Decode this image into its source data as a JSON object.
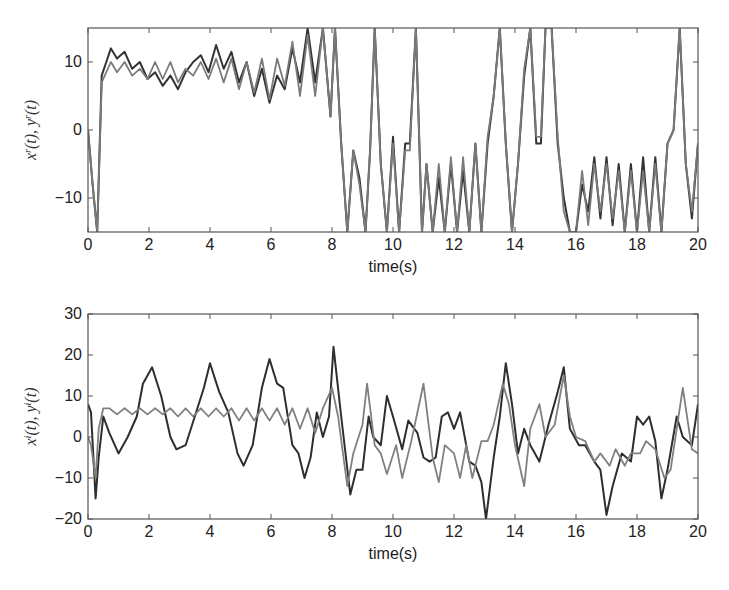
{
  "chart_data": [
    {
      "type": "line",
      "title": "",
      "xlabel": "time(s)",
      "ylabel": "x^r(t), y^r(t)",
      "xlim": [
        0,
        20
      ],
      "ylim": [
        -15,
        15
      ],
      "xticks": [
        0,
        2,
        4,
        6,
        8,
        10,
        12,
        14,
        16,
        18,
        20
      ],
      "yticks": [
        -10,
        0,
        10
      ],
      "grid": false,
      "legend": null,
      "series": [
        {
          "name": "x^r(t)",
          "color": "#333333",
          "x": [
            0,
            0.15,
            0.3,
            0.45,
            0.6,
            0.75,
            0.95,
            1.2,
            1.45,
            1.7,
            1.95,
            2.2,
            2.45,
            2.7,
            2.95,
            3.2,
            3.45,
            3.7,
            3.95,
            4.2,
            4.45,
            4.7,
            4.95,
            5.2,
            5.45,
            5.7,
            5.95,
            6.2,
            6.45,
            6.7,
            6.95,
            7.2,
            7.45,
            7.7,
            7.95,
            8.1,
            8.3,
            8.5,
            8.7,
            8.9,
            9.1,
            9.25,
            9.4,
            9.6,
            9.8,
            10.0,
            10.2,
            10.4,
            10.55,
            10.75,
            10.95,
            11.1,
            11.3,
            11.5,
            11.7,
            11.9,
            12.1,
            12.3,
            12.5,
            12.7,
            12.9,
            13.1,
            13.3,
            13.5,
            13.7,
            13.9,
            14.1,
            14.3,
            14.5,
            14.7,
            14.85,
            15.0,
            15.2,
            15.4,
            15.6,
            15.8,
            16.0,
            16.2,
            16.4,
            16.6,
            16.8,
            17.0,
            17.2,
            17.4,
            17.6,
            17.8,
            18.0,
            18.2,
            18.4,
            18.6,
            18.8,
            19.0,
            19.2,
            19.4,
            19.6,
            19.8,
            20.0
          ],
          "y": [
            0,
            -8,
            -15,
            8,
            10,
            12,
            10.5,
            11.5,
            9,
            10,
            7.5,
            8.5,
            6.5,
            8,
            6,
            8.5,
            10,
            11,
            8.5,
            12.5,
            9,
            11.5,
            7,
            10,
            5,
            9,
            4,
            8,
            6,
            12,
            7,
            15,
            7,
            15,
            2,
            15,
            -2,
            -15,
            -3,
            -7,
            -15,
            -3,
            15,
            -5,
            -15,
            -1,
            -15,
            -2,
            -2,
            15,
            -15,
            -5,
            -15,
            -7,
            -15,
            -5,
            -15,
            -6,
            -15,
            -2,
            -15,
            -2,
            5,
            15,
            -2,
            -15,
            -5,
            8,
            15,
            -2,
            -2,
            15,
            15,
            -2,
            -10,
            -15,
            -15,
            -8,
            -12,
            -4,
            -13,
            -4,
            -14,
            -5,
            -15,
            -5,
            -15,
            -4,
            -15,
            -4,
            -15,
            -2,
            0,
            15,
            -5,
            -13,
            -2
          ]
        },
        {
          "name": "y^r(t)",
          "color": "#7a7a7a",
          "x": [
            0,
            0.15,
            0.3,
            0.45,
            0.6,
            0.75,
            0.95,
            1.2,
            1.45,
            1.7,
            1.95,
            2.2,
            2.45,
            2.7,
            2.95,
            3.2,
            3.45,
            3.7,
            3.95,
            4.2,
            4.45,
            4.7,
            4.95,
            5.2,
            5.45,
            5.7,
            5.95,
            6.2,
            6.45,
            6.7,
            6.95,
            7.2,
            7.45,
            7.7,
            7.95,
            8.1,
            8.3,
            8.5,
            8.7,
            8.9,
            9.1,
            9.25,
            9.4,
            9.6,
            9.8,
            10.0,
            10.2,
            10.4,
            10.55,
            10.75,
            10.95,
            11.1,
            11.3,
            11.5,
            11.7,
            11.9,
            12.1,
            12.3,
            12.5,
            12.7,
            12.9,
            13.1,
            13.3,
            13.5,
            13.7,
            13.9,
            14.1,
            14.3,
            14.5,
            14.7,
            14.85,
            15.0,
            15.2,
            15.4,
            15.6,
            15.8,
            16.0,
            16.2,
            16.4,
            16.6,
            16.8,
            17.0,
            17.2,
            17.4,
            17.6,
            17.8,
            18.0,
            18.2,
            18.4,
            18.6,
            18.8,
            19.0,
            19.2,
            19.4,
            19.6,
            19.8,
            20.0
          ],
          "y": [
            0,
            -8,
            -15,
            7,
            8.5,
            10,
            8.5,
            10,
            8,
            9,
            7.5,
            10,
            7.5,
            10,
            7,
            9,
            8,
            10,
            7.5,
            10.5,
            7,
            10.5,
            6,
            10,
            5.5,
            10.5,
            4.5,
            10.5,
            6.5,
            13,
            5,
            14,
            5,
            15,
            2,
            15,
            -2,
            -15,
            -3,
            -8,
            -15,
            -3,
            15,
            -5,
            -15,
            -2,
            -15,
            -3,
            -3,
            15,
            -15,
            -5,
            -15,
            -5,
            -15,
            -4,
            -15,
            -4,
            -15,
            -2,
            -15,
            -1,
            5,
            15,
            -2,
            -15,
            -5,
            9,
            15,
            -1,
            -1,
            15,
            15,
            -1,
            -12,
            -15,
            -15,
            -6,
            -14,
            -5,
            -12,
            -5,
            -13,
            -6,
            -15,
            -6,
            -15,
            -6,
            -15,
            -5,
            -15,
            -2,
            0,
            15,
            -5,
            -12,
            -2
          ]
        }
      ]
    },
    {
      "type": "line",
      "title": "",
      "xlabel": "time(s)",
      "ylabel": "x^i(t), y^i(t)",
      "xlim": [
        0,
        20
      ],
      "ylim": [
        -20,
        30
      ],
      "xticks": [
        0,
        2,
        4,
        6,
        8,
        10,
        12,
        14,
        16,
        18,
        20
      ],
      "yticks": [
        -20,
        -10,
        0,
        10,
        20,
        30
      ],
      "grid": false,
      "legend": null,
      "series": [
        {
          "name": "x^i(t)",
          "color": "#2e2e2e",
          "x": [
            0,
            0.1,
            0.25,
            0.35,
            0.5,
            0.7,
            1.0,
            1.3,
            1.6,
            1.8,
            2.1,
            2.4,
            2.7,
            2.9,
            3.2,
            3.5,
            3.8,
            4.0,
            4.3,
            4.6,
            4.9,
            5.1,
            5.4,
            5.7,
            5.95,
            6.2,
            6.4,
            6.7,
            6.9,
            7.1,
            7.3,
            7.5,
            7.7,
            7.9,
            8.05,
            8.3,
            8.6,
            8.8,
            9.0,
            9.2,
            9.35,
            9.6,
            9.8,
            10.0,
            10.3,
            10.5,
            10.8,
            11.0,
            11.2,
            11.4,
            11.6,
            11.8,
            12.0,
            12.2,
            12.5,
            12.7,
            12.9,
            13.05,
            13.3,
            13.5,
            13.7,
            13.9,
            14.1,
            14.3,
            14.5,
            14.8,
            15.1,
            15.4,
            15.6,
            15.8,
            16.1,
            16.3,
            16.6,
            16.8,
            17.0,
            17.2,
            17.5,
            17.8,
            18.0,
            18.2,
            18.4,
            18.6,
            18.8,
            19.0,
            19.3,
            19.5,
            19.8,
            20.0
          ],
          "y": [
            8,
            6,
            -15,
            -5,
            5,
            1,
            -4,
            0,
            5,
            13,
            17,
            10,
            0,
            -3,
            -2,
            5,
            12,
            18,
            11,
            6,
            -4,
            -7,
            -2,
            12,
            19,
            13,
            12,
            -2,
            -4,
            -10,
            -5,
            6,
            0,
            5,
            22,
            5,
            -14,
            -8,
            -8,
            5,
            0,
            -2,
            10,
            5,
            -3,
            4,
            1,
            -5,
            -6,
            -5,
            5,
            6,
            2,
            6,
            -6,
            -7,
            -11,
            -20,
            -5,
            5,
            18,
            8,
            -4,
            2,
            -2,
            -6,
            3,
            11,
            17,
            2,
            -2,
            -2,
            -6,
            -8,
            -19,
            -12,
            -4,
            -6,
            5,
            3,
            5,
            -1,
            -15,
            -8,
            5,
            0,
            -2,
            8
          ]
        },
        {
          "name": "y^i(t)",
          "color": "#808080",
          "x": [
            0,
            0.1,
            0.25,
            0.35,
            0.5,
            0.7,
            0.95,
            1.2,
            1.45,
            1.7,
            1.95,
            2.2,
            2.45,
            2.7,
            2.95,
            3.2,
            3.45,
            3.7,
            3.95,
            4.2,
            4.45,
            4.7,
            4.95,
            5.2,
            5.45,
            5.7,
            5.95,
            6.2,
            6.45,
            6.7,
            6.95,
            7.2,
            7.45,
            7.7,
            8.0,
            8.2,
            8.5,
            8.7,
            9.0,
            9.15,
            9.4,
            9.6,
            9.8,
            10.1,
            10.3,
            10.6,
            11.0,
            11.3,
            11.5,
            11.7,
            12.0,
            12.2,
            12.4,
            12.6,
            12.9,
            13.1,
            13.3,
            13.6,
            13.8,
            14.0,
            14.3,
            14.5,
            14.8,
            15.0,
            15.3,
            15.6,
            15.8,
            16.0,
            16.3,
            16.6,
            16.8,
            17.1,
            17.3,
            17.6,
            17.8,
            18.1,
            18.3,
            18.6,
            18.9,
            19.1,
            19.3,
            19.5,
            19.8,
            20.0
          ],
          "y": [
            0,
            -2,
            -10,
            2,
            7,
            7,
            5.5,
            7,
            5.5,
            7,
            5.5,
            7,
            5.5,
            7,
            5,
            7,
            5,
            7,
            5,
            7,
            5,
            7,
            4,
            7,
            4,
            7,
            4,
            7,
            3,
            7,
            2,
            7,
            1,
            7,
            12,
            5,
            -12,
            -4,
            3,
            13,
            -2,
            -4,
            -9,
            -2,
            -10,
            -1,
            13,
            -5,
            -11,
            -2,
            -4,
            -10,
            -2,
            -10,
            -1,
            -1,
            3,
            13,
            8,
            -2,
            -12,
            2,
            8,
            0,
            3,
            15,
            5,
            0,
            -1,
            -6,
            -4,
            -7,
            -3,
            -7,
            -4,
            -4,
            -1,
            -3,
            -10,
            -8,
            2,
            12,
            -3,
            -4,
            -10,
            -2
          ]
        }
      ]
    }
  ],
  "axes": {
    "top": {
      "xlabel": "time(s)",
      "ylabel_tex": "x^r(t), y^r(t)",
      "xtick_labels": [
        "0",
        "2",
        "4",
        "6",
        "8",
        "10",
        "12",
        "14",
        "16",
        "18",
        "20"
      ],
      "ytick_labels": [
        "10",
        "0",
        "−10"
      ]
    },
    "bottom": {
      "xlabel": "time(s)",
      "ylabel_tex": "x^i(t), y^i(t)",
      "xtick_labels": [
        "0",
        "2",
        "4",
        "6",
        "8",
        "10",
        "12",
        "14",
        "16",
        "18",
        "20"
      ],
      "ytick_labels": [
        "30",
        "20",
        "10",
        "0",
        "−10",
        "−20"
      ]
    }
  }
}
